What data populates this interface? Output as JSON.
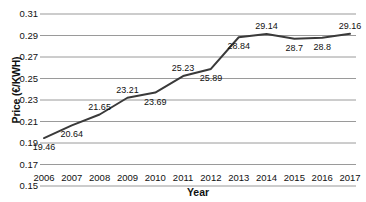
{
  "chart_data": {
    "type": "line",
    "title": "",
    "xlabel": "Year",
    "ylabel": "Price (€/KWH)",
    "categories": [
      "2006",
      "2007",
      "2008",
      "2009",
      "2010",
      "2011",
      "2012",
      "2013",
      "2014",
      "2015",
      "2016",
      "2017"
    ],
    "values": [
      0.1946,
      0.2064,
      0.2165,
      0.2321,
      0.2369,
      0.2523,
      0.2589,
      0.2884,
      0.2914,
      0.287,
      0.288,
      0.2916
    ],
    "point_labels": [
      "19.46",
      "20.64",
      "21.65",
      "23.21",
      "23.69",
      "25.23",
      "25.89",
      "28.84",
      "29.14",
      "28.7",
      "28.8",
      "29.16"
    ],
    "label_side": [
      "below",
      "below",
      "above",
      "above",
      "below",
      "above",
      "below",
      "below",
      "above",
      "below",
      "below",
      "above"
    ],
    "ylim": [
      0.15,
      0.31
    ],
    "ytick_labels": [
      "0.31",
      "0.29",
      "0.27",
      "0.25",
      "0.23",
      "0.21",
      "0.19",
      "0.17",
      "0.15"
    ],
    "ytick_values": [
      0.31,
      0.29,
      0.27,
      0.25,
      0.23,
      0.21,
      0.19,
      0.17,
      0.15
    ],
    "grid": true,
    "legend": false,
    "series_color": "#3a3a3a",
    "grid_color": "#9a9a9a"
  }
}
